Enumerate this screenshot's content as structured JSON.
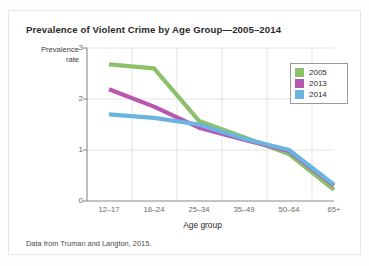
{
  "figure": {
    "title": "Prevalence of Violent Crime by Age Group—2005–2014",
    "source_note": "Data from Truman and Langton, 2015."
  },
  "chart_data": {
    "type": "line",
    "title": "Prevalence of Violent Crime by Age Group—2005–2014",
    "xlabel": "Age group",
    "ylabel": "Prevalence rate",
    "categories": [
      "12–17",
      "18–24",
      "25–34",
      "35–49",
      "50–64",
      "65+"
    ],
    "ylim": [
      0,
      3
    ],
    "yticks": [
      0,
      1,
      2,
      3
    ],
    "grid": true,
    "legend_position": "top-right",
    "series": [
      {
        "name": "2005",
        "color": "#8cc06a",
        "values": [
          2.68,
          2.6,
          1.57,
          1.25,
          0.92,
          0.22
        ]
      },
      {
        "name": "2013",
        "color": "#b658b0",
        "values": [
          2.19,
          1.85,
          1.44,
          1.2,
          0.98,
          0.3
        ]
      },
      {
        "name": "2014",
        "color": "#6bb3e0",
        "values": [
          1.7,
          1.63,
          1.5,
          1.22,
          1.0,
          0.32
        ]
      }
    ]
  },
  "legend": {
    "entries": [
      {
        "label": "2005",
        "color": "#8cc06a"
      },
      {
        "label": "2013",
        "color": "#b658b0"
      },
      {
        "label": "2014",
        "color": "#6bb3e0"
      }
    ]
  },
  "axes": {
    "yticks": [
      "3",
      "2",
      "1",
      "0"
    ],
    "xticks": [
      "12–17",
      "18–24",
      "25–34",
      "35–49",
      "50–64",
      "65+"
    ],
    "ylabel_line1": "Prevalence",
    "ylabel_line2": "rate",
    "xlabel": "Age group"
  }
}
